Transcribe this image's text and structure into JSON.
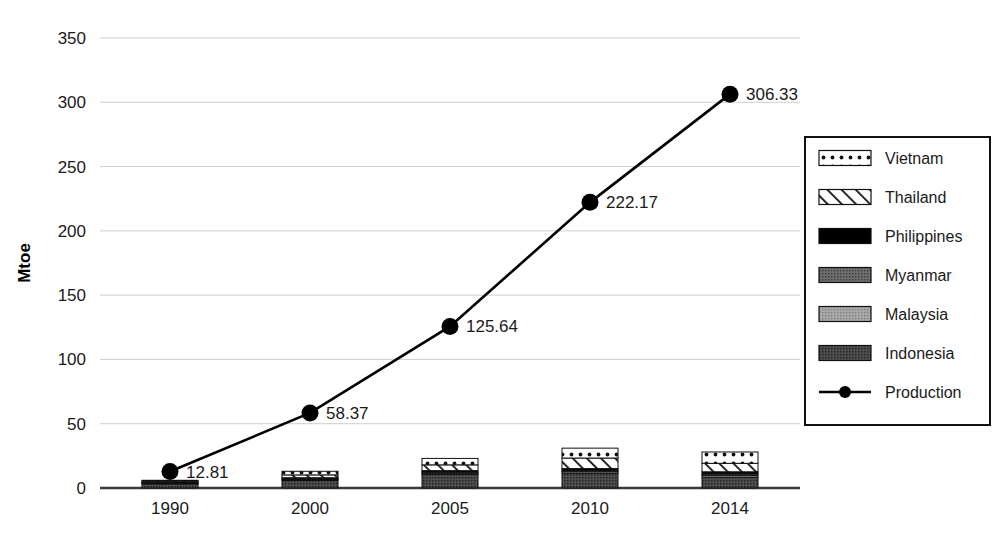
{
  "chart_data": {
    "type": "bar",
    "title": "",
    "subtitle": "",
    "xlabel": "",
    "ylabel": "Mtoe",
    "categories": [
      "1990",
      "2000",
      "2005",
      "2010",
      "2014"
    ],
    "ylim": [
      0,
      350
    ],
    "ytick_labels": [
      "0",
      "50",
      "100",
      "150",
      "200",
      "250",
      "300",
      "350"
    ],
    "ytick_values": [
      0,
      50,
      100,
      150,
      200,
      250,
      300,
      350
    ],
    "grid": true,
    "legend_position": "right",
    "series": [
      {
        "name": "Indonesia",
        "pattern": "dark-dotted",
        "color": "#4a4a4a",
        "values": [
          3.2,
          5.8,
          10.5,
          11.5,
          8.5
        ]
      },
      {
        "name": "Malaysia",
        "pattern": "light-dotted",
        "color": "#9b9b9b",
        "values": [
          0.6,
          0.8,
          1.0,
          1.2,
          1.4
        ]
      },
      {
        "name": "Myanmar",
        "pattern": "mid-dotted",
        "color": "#6e6e6e",
        "values": [
          0.5,
          0.7,
          0.9,
          1.0,
          1.1
        ]
      },
      {
        "name": "Philippines",
        "pattern": "solid-black",
        "color": "#000000",
        "values": [
          0.4,
          0.7,
          1.1,
          1.4,
          1.6
        ]
      },
      {
        "name": "Thailand",
        "pattern": "diagonal-hatch",
        "color": "#ffffff",
        "values": [
          0.8,
          2.2,
          4.5,
          8.2,
          6.6
        ]
      },
      {
        "name": "Vietnam",
        "pattern": "dotted-open",
        "color": "#ffffff",
        "values": [
          0.5,
          2.8,
          5.0,
          7.7,
          8.8
        ]
      }
    ],
    "line_series": {
      "name": "Production",
      "marker": "circle",
      "color": "#000000",
      "values": [
        12.81,
        58.37,
        125.64,
        222.17,
        306.33
      ],
      "labels": [
        "12.81",
        "58.37",
        "125.64",
        "222.17",
        "306.33"
      ]
    }
  },
  "legend": {
    "items": [
      {
        "label": "Vietnam",
        "swatch": "dotted-open"
      },
      {
        "label": "Thailand",
        "swatch": "diagonal-hatch"
      },
      {
        "label": "Philippines",
        "swatch": "solid-black"
      },
      {
        "label": "Myanmar",
        "swatch": "mid-dotted"
      },
      {
        "label": "Malaysia",
        "swatch": "light-dotted"
      },
      {
        "label": "Indonesia",
        "swatch": "dark-dotted"
      },
      {
        "label": "Production",
        "swatch": "line-marker"
      }
    ]
  },
  "colors": {
    "grid": "#cfcfcf",
    "axis": "#3a3a3a",
    "text": "#1a1a1a",
    "line": "#000000"
  }
}
